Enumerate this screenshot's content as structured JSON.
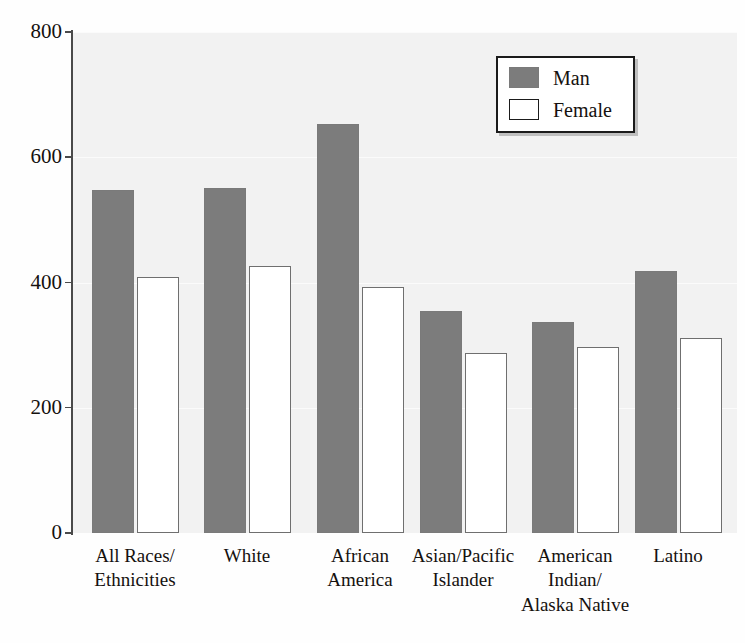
{
  "chart_data": {
    "type": "bar",
    "title": "",
    "xlabel": "",
    "ylabel": "",
    "ylim": [
      0,
      800
    ],
    "grid": true,
    "legend_position": "top-right",
    "categories": [
      "All Races/\nEthnicities",
      "White",
      "African\nAmerica",
      "Asian/Pacific\nIslander",
      "American\nIndian/\nAlaska Native",
      "Latino"
    ],
    "series": [
      {
        "name": "Man",
        "color": "#7c7c7c",
        "values": [
          548,
          551,
          653,
          354,
          337,
          418
        ]
      },
      {
        "name": "Female",
        "color": "#ffffff",
        "values": [
          409,
          427,
          393,
          287,
          297,
          311
        ]
      }
    ],
    "y_ticks": [
      0,
      200,
      400,
      600,
      800
    ],
    "y_tick_labels": [
      "0",
      "200",
      "400",
      "600",
      "800"
    ]
  },
  "legend": {
    "items": [
      {
        "label": "Man",
        "swatch": "man"
      },
      {
        "label": "Female",
        "swatch": "female"
      }
    ]
  },
  "colors": {
    "man_bar": "#7c7c7c",
    "female_bar": "#ffffff",
    "female_border": "#6f6f6f",
    "plot_background": "#f2f2f2",
    "axis": "#4a4a4a",
    "text": "#15110e"
  }
}
